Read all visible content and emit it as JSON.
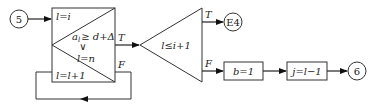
{
  "diagram": {
    "type": "flowchart",
    "nodes": {
      "start_connector": {
        "label": "5"
      },
      "loop_box": {
        "init": "l=i",
        "condition_top": "a_l ≥ d+Δ",
        "condition_top_base": "a",
        "condition_top_sub": "l",
        "condition_top_rest": "≥ d+Δ",
        "or_symbol": "∨",
        "condition_bottom": "l=n",
        "increment": "l=l+1",
        "true_label": "T",
        "false_label": "F"
      },
      "decision": {
        "label": "l≤i+1",
        "true_label": "T",
        "false_label": "F"
      },
      "exit_connector": {
        "label": "E4"
      },
      "assign_b": {
        "label": "b=1"
      },
      "assign_j": {
        "label": "j=l−1"
      },
      "end_connector": {
        "label": "6"
      }
    },
    "edges": [
      {
        "from": "5",
        "to": "loop_box"
      },
      {
        "from": "loop_box",
        "to": "decision",
        "label": "T"
      },
      {
        "from": "loop_box",
        "to": "loop_box",
        "label": "F"
      },
      {
        "from": "decision",
        "to": "E4",
        "label": "T"
      },
      {
        "from": "decision",
        "to": "b=1",
        "label": "F"
      },
      {
        "from": "b=1",
        "to": "j=l−1"
      },
      {
        "from": "j=l−1",
        "to": "6"
      }
    ]
  }
}
